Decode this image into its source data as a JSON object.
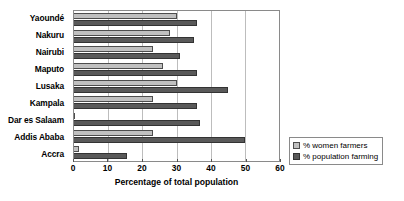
{
  "chart_data": {
    "type": "bar",
    "orientation": "horizontal",
    "title": "",
    "xlabel": "Percentage of total population",
    "ylabel": "",
    "xlim": [
      0,
      60
    ],
    "xticks": [
      0,
      10,
      20,
      30,
      40,
      50,
      60
    ],
    "grid": true,
    "legend_position": "bottom-right",
    "categories": [
      "Yaoundé",
      "Nakuru",
      "Nairubi",
      "Maputo",
      "Lusaka",
      "Kampala",
      "Dar es Salaam",
      "Addis Ababa",
      "Accra"
    ],
    "series": [
      {
        "name": "% women farmers",
        "color": "#c0c0c0",
        "values": [
          30,
          28,
          23,
          26,
          30,
          23,
          0,
          23,
          1.5
        ]
      },
      {
        "name": "% population farming",
        "color": "#595959",
        "values": [
          36,
          35,
          31,
          36,
          45,
          36,
          37,
          50,
          15.5
        ]
      }
    ]
  },
  "axis": {
    "x_title": "Percentage of total population",
    "x_tick_labels": [
      "0",
      "10",
      "20",
      "30",
      "40",
      "50",
      "60"
    ]
  },
  "legend": {
    "items": [
      {
        "label": "% women farmers"
      },
      {
        "label": "% population farming"
      }
    ]
  }
}
